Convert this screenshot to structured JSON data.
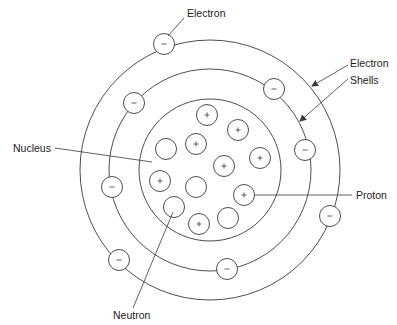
{
  "diagram": {
    "labels": {
      "electron_top": "Electron",
      "shells_line1": "Electron",
      "shells_line2": "Shells",
      "nucleus": "Nucleus",
      "proton": "Proton",
      "neutron": "Neutron"
    },
    "colors": {
      "stroke": "#3a3a3a",
      "text": "#222222",
      "background": "#ffffff"
    },
    "center": [
      210,
      170
    ],
    "shells": [
      {
        "name": "outer-shell",
        "r": 130
      },
      {
        "name": "middle-shell",
        "r": 101
      },
      {
        "name": "nucleus-boundary",
        "r": 71
      }
    ],
    "electrons": [
      {
        "x": 164,
        "y": 44,
        "sign": "-"
      },
      {
        "x": 134,
        "y": 103,
        "sign": "-"
      },
      {
        "x": 274,
        "y": 89,
        "sign": "-"
      },
      {
        "x": 305,
        "y": 150,
        "sign": "-"
      },
      {
        "x": 112,
        "y": 187,
        "sign": "-"
      },
      {
        "x": 330,
        "y": 216,
        "sign": "-"
      },
      {
        "x": 119,
        "y": 260,
        "sign": "-"
      },
      {
        "x": 227,
        "y": 269,
        "sign": "-"
      }
    ],
    "protons": [
      {
        "x": 207,
        "y": 115,
        "sign": "+"
      },
      {
        "x": 238,
        "y": 130,
        "sign": "+"
      },
      {
        "x": 196,
        "y": 144,
        "sign": "+"
      },
      {
        "x": 260,
        "y": 158,
        "sign": "+"
      },
      {
        "x": 224,
        "y": 166,
        "sign": "+"
      },
      {
        "x": 160,
        "y": 181,
        "sign": "+"
      },
      {
        "x": 244,
        "y": 195,
        "sign": "+"
      },
      {
        "x": 199,
        "y": 224,
        "sign": "+"
      }
    ],
    "neutrons": [
      {
        "x": 166,
        "y": 149
      },
      {
        "x": 196,
        "y": 187
      },
      {
        "x": 174,
        "y": 207
      },
      {
        "x": 228,
        "y": 218
      }
    ],
    "counts": {
      "electrons": 8,
      "protons": 8,
      "neutrons": 4
    }
  }
}
